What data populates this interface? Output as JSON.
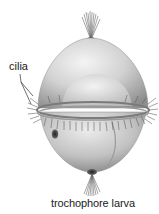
{
  "figure": {
    "subject": "trochophore larva",
    "caption": "trochophore larva",
    "labels": [
      {
        "text": "cilia",
        "points_to": "ciliary band (prototroch)",
        "leader_lines": 2
      }
    ],
    "parts_depicted": [
      {
        "name": "apical-tuft",
        "icon": "cilia-tuft-icon"
      },
      {
        "name": "body",
        "icon": "egg-shaped-body-icon"
      },
      {
        "name": "ciliary-band",
        "icon": "cilia-ring-icon"
      },
      {
        "name": "lateral-opening",
        "icon": "pore-icon"
      },
      {
        "name": "bottom-tuft",
        "icon": "cilia-tuft-icon"
      }
    ],
    "colors": {
      "background": "#ffffff",
      "body_light": "#e6e6e6",
      "body_mid": "#b9b9b9",
      "body_dark": "#7a7a7a",
      "cilia": "#5a5a5a",
      "text": "#1a1a1a"
    }
  }
}
